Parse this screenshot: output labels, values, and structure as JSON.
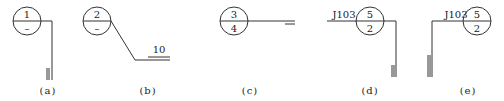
{
  "diagrams": [
    {
      "id": "a",
      "caption": "(a)",
      "circle": {
        "top": "1",
        "bottom": "–"
      },
      "leader": "horizontal then vertical down",
      "end_mark": "double vertical bar"
    },
    {
      "id": "b",
      "caption": "(b)",
      "circle": {
        "top": "2",
        "bottom": "–"
      },
      "leader": "diagonal down-right then horizontal",
      "end_mark": "double horizontal bar",
      "label": "10"
    },
    {
      "id": "c",
      "caption": "(c)",
      "circle": {
        "top": "3",
        "bottom": "4"
      },
      "leader": "horizontal",
      "end_mark": "single short bar"
    },
    {
      "id": "d",
      "caption": "(d)",
      "circle": {
        "top": "5",
        "bottom": "2"
      },
      "label": "J103",
      "leader": "horizontal then vertical down",
      "end_mark": "double vertical bar"
    },
    {
      "id": "e",
      "caption": "(e)",
      "circle": {
        "top": "5",
        "bottom": "2"
      },
      "label": "J103",
      "leader": "horizontal left then vertical down",
      "end_mark": "double vertical bar"
    }
  ]
}
